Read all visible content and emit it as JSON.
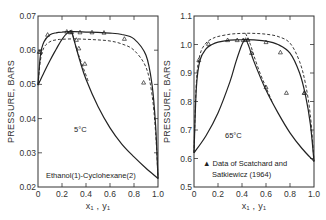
{
  "chart_data": [
    {
      "type": "line",
      "title": "5°C",
      "system": "Ethanol(1)-Cyclohexane(2)",
      "xlabel": "x1, y1",
      "ylabel": "PRESSURE, BARS",
      "xlim": [
        0,
        1.0
      ],
      "ylim": [
        0.02,
        0.07
      ],
      "xticks": [
        "0",
        "0.2",
        "0.4",
        "0.6",
        "0.8",
        "1.0"
      ],
      "yticks": [
        "0.02",
        "0.03",
        "0.04",
        "0.05",
        "0.06",
        "0.07"
      ],
      "series": [
        {
          "name": "P-x (bubble, solid)",
          "style": "solid",
          "x": [
            0,
            0.02,
            0.05,
            0.1,
            0.15,
            0.2,
            0.25,
            0.3,
            0.4,
            0.5,
            0.6,
            0.7,
            0.8,
            0.9,
            0.95,
            0.98,
            1.0
          ],
          "y": [
            0.0498,
            0.0585,
            0.0625,
            0.0645,
            0.0651,
            0.0653,
            0.0654,
            0.0654,
            0.0653,
            0.0652,
            0.065,
            0.0646,
            0.0633,
            0.0585,
            0.05,
            0.038,
            0.0225
          ]
        },
        {
          "name": "P-x (bubble, dashed)",
          "style": "dashed",
          "x": [
            0,
            0.02,
            0.05,
            0.1,
            0.15,
            0.2,
            0.3,
            0.4,
            0.5,
            0.6,
            0.7,
            0.8,
            0.9,
            0.95,
            0.98,
            1.0
          ],
          "y": [
            0.0498,
            0.057,
            0.0608,
            0.0625,
            0.063,
            0.0632,
            0.0633,
            0.0632,
            0.063,
            0.0627,
            0.0618,
            0.06,
            0.055,
            0.047,
            0.036,
            0.0225
          ]
        },
        {
          "name": "P-y (dew, solid)",
          "style": "solid",
          "x": [
            0,
            0.05,
            0.1,
            0.15,
            0.2,
            0.25,
            0.28,
            0.3,
            0.35,
            0.4,
            0.5,
            0.6,
            0.7,
            0.8,
            0.9,
            1.0
          ],
          "y": [
            0.0498,
            0.0535,
            0.057,
            0.0602,
            0.0632,
            0.0652,
            0.0654,
            0.063,
            0.0568,
            0.0515,
            0.0435,
            0.0373,
            0.0325,
            0.0288,
            0.0255,
            0.0225
          ]
        },
        {
          "name": "P-y (dew, dashed)",
          "style": "dashed",
          "x": [
            0.26,
            0.29,
            0.32,
            0.36,
            0.42
          ],
          "y": [
            0.0654,
            0.0642,
            0.0605,
            0.0565,
            0.0508
          ]
        }
      ],
      "data_points": {
        "marker": "triangle",
        "x": [
          0.01,
          0.02,
          0.08,
          0.24,
          0.27,
          0.28,
          0.35,
          0.45,
          0.55,
          0.72,
          0.88,
          0.32,
          0.34,
          0.39
        ],
        "y": [
          0.0595,
          0.0595,
          0.0645,
          0.0654,
          0.0652,
          0.0653,
          0.0652,
          0.0652,
          0.0651,
          0.0633,
          0.0505,
          0.063,
          0.0605,
          0.056
        ]
      },
      "annotations": [
        "5°C",
        "Ethanol(1)-Cyclohexane(2)"
      ]
    },
    {
      "type": "line",
      "title": "65°C",
      "xlabel": "x1, y1",
      "ylabel": "PRESSURE, BARS",
      "xlim": [
        0,
        1.0
      ],
      "ylim": [
        0.5,
        1.1
      ],
      "xticks": [
        "0",
        "0.2",
        "0.4",
        "0.6",
        "0.8",
        "1.0"
      ],
      "yticks": [
        "0.5",
        "0.6",
        "0.7",
        "0.8",
        "0.9",
        "1.0",
        "1.1"
      ],
      "series": [
        {
          "name": "P-x (bubble, solid)",
          "style": "solid",
          "x": [
            0,
            0.02,
            0.05,
            0.1,
            0.15,
            0.2,
            0.3,
            0.4,
            0.5,
            0.6,
            0.7,
            0.8,
            0.88,
            0.93,
            0.97,
            1.0
          ],
          "y": [
            0.62,
            0.85,
            0.945,
            0.985,
            1.0,
            1.008,
            1.015,
            1.017,
            1.016,
            1.012,
            1.0,
            0.97,
            0.9,
            0.82,
            0.72,
            0.59
          ]
        },
        {
          "name": "P-x (bubble, dashed)",
          "style": "dashed",
          "x": [
            0,
            0.02,
            0.05,
            0.1,
            0.15,
            0.2,
            0.3,
            0.4,
            0.5,
            0.6,
            0.7,
            0.8,
            0.88,
            0.93,
            0.97,
            1.0
          ],
          "y": [
            0.62,
            0.87,
            0.965,
            1.005,
            1.02,
            1.028,
            1.036,
            1.039,
            1.039,
            1.036,
            1.028,
            1.005,
            0.94,
            0.86,
            0.75,
            0.59
          ]
        },
        {
          "name": "P-y (dew, solid)",
          "style": "solid",
          "x": [
            0,
            0.1,
            0.2,
            0.3,
            0.35,
            0.4,
            0.43,
            0.46,
            0.5,
            0.6,
            0.7,
            0.8,
            0.9,
            1.0
          ],
          "y": [
            0.62,
            0.68,
            0.76,
            0.87,
            0.94,
            1.0,
            1.017,
            0.99,
            0.94,
            0.84,
            0.76,
            0.69,
            0.635,
            0.59
          ]
        },
        {
          "name": "P-y (dew, dashed)",
          "style": "dashed",
          "x": [
            0.43,
            0.47,
            0.5,
            0.55,
            0.6,
            0.65
          ],
          "y": [
            1.039,
            1.0,
            0.96,
            0.9,
            0.85,
            0.8
          ]
        }
      ],
      "data_points": {
        "marker": "triangle",
        "x": [
          0.04,
          0.12,
          0.28,
          0.36,
          0.41,
          0.43,
          0.45,
          0.6,
          0.72,
          0.92,
          0.48,
          0.6,
          0.77,
          0.92
        ],
        "y": [
          0.945,
          1.002,
          1.015,
          1.015,
          1.015,
          1.016,
          1.016,
          1.008,
          0.972,
          0.83,
          0.97,
          0.85,
          0.83,
          0.83
        ]
      },
      "annotations": [
        "65°C",
        "▲ Data of Scatchard and",
        "Satkiewicz (1964)"
      ]
    }
  ],
  "labels": {
    "left_title": "5°C",
    "left_system": "Ethanol(1)-Cyclohexane(2)",
    "right_title": "65°C",
    "legend_line1": "▲ Data of Scatchard and",
    "legend_line2": "Satkiewicz (1964)",
    "ylabel": "PRESSURE, BARS",
    "xlabel": "x₁ , y₁",
    "left_yticks": [
      "0.07",
      "0.06",
      "0.05",
      "0.04",
      "0.03",
      "0.02"
    ],
    "right_yticks": [
      "1.1",
      "1.0",
      "0.9",
      "0.8",
      "0.7",
      "0.6",
      "0.5"
    ],
    "xticks": [
      "0",
      "0.2",
      "0.4",
      "0.6",
      "0.8",
      "1.0"
    ]
  }
}
